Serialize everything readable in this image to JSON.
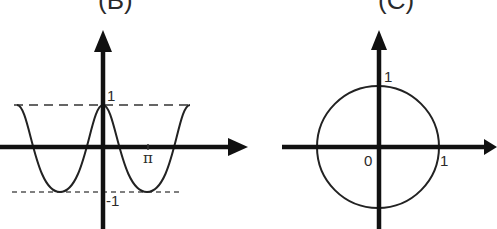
{
  "panels": [
    {
      "title": "(B)",
      "description": "cosine-like wave bounded by dashed lines at y=1 and y=-1",
      "labels": {
        "y_max": "1",
        "x_tick": "π",
        "y_min": "-1"
      }
    },
    {
      "title": "(C)",
      "description": "unit circle centered at origin",
      "labels": {
        "y_tick": "1",
        "origin": "0",
        "x_tick": "1"
      }
    }
  ],
  "colors": {
    "ink": "#1a1a1a",
    "background": "#ffffff"
  }
}
